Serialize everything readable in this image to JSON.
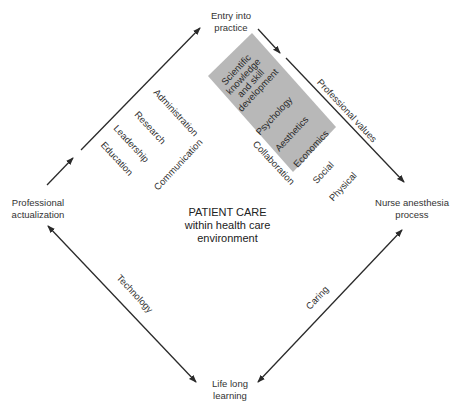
{
  "diagram": {
    "nodes": {
      "top": {
        "line1": "Entry into",
        "line2": "practice"
      },
      "left": {
        "line1": "Professional",
        "line2": "actualization"
      },
      "right": {
        "line1": "Nurse anesthesia",
        "line2": "process"
      },
      "bottom": {
        "line1": "Life long",
        "line2": "learning"
      }
    },
    "center": {
      "line1": "PATIENT CARE",
      "line2": "within health care",
      "line3": "environment"
    },
    "edges": {
      "left_to_top": {
        "direction": "Professional actualization → Entry into practice",
        "labels_above": [
          "Administration",
          "Research",
          "Leadership",
          "Education"
        ],
        "labels_below": [
          "Communication"
        ]
      },
      "top_to_right": {
        "direction": "Entry into practice → Nurse anesthesia process",
        "label": "Professional values",
        "shaded_box": {
          "color": "#b8b8b8",
          "items": [
            "Scientific knowledge and skill development",
            "Psychology",
            "Aesthetics",
            "Economics"
          ],
          "item_lines": {
            "scientific": [
              "Scientific",
              "knowledge",
              "and skill",
              "development"
            ]
          }
        },
        "labels_below": [
          "Collaboration",
          "Social",
          "Physical"
        ]
      },
      "left_to_bottom": {
        "direction": "bidirectional",
        "label": "Technology"
      },
      "bottom_to_right": {
        "direction": "bidirectional",
        "label": "Caring"
      }
    },
    "colors": {
      "line": "#2a2a2a",
      "box": "#b8b8b8",
      "text": "#333333",
      "background": "#ffffff"
    }
  }
}
